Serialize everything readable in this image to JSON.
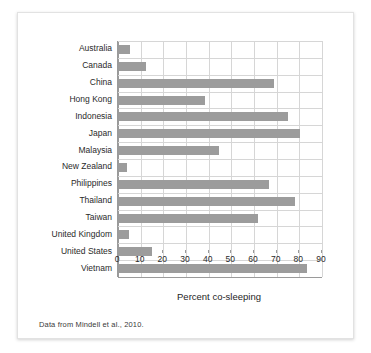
{
  "figure": {
    "caption": "Data from Mindell et al., 2010.",
    "bar_color": "#9c9c9c",
    "grid_color": "#d6d6d6",
    "axis_color": "#9a9a9a"
  },
  "chart_data": {
    "type": "bar",
    "orientation": "horizontal",
    "title": "",
    "xlabel": "Percent co-sleeping",
    "ylabel": "",
    "xlim": [
      0,
      90
    ],
    "xticks": [
      0,
      10,
      20,
      30,
      40,
      50,
      60,
      70,
      80,
      90
    ],
    "xtick_labels": [
      "0",
      "10",
      "20",
      "30",
      "40",
      "50",
      "60",
      "70",
      "80",
      "90"
    ],
    "grid": true,
    "legend": null,
    "categories": [
      "Australia",
      "Canada",
      "China",
      "Hong Kong",
      "Indonesia",
      "Japan",
      "Malaysia",
      "New Zealand",
      "Philippines",
      "Thailand",
      "Taiwan",
      "United Kingdom",
      "United States",
      "Vietnam"
    ],
    "values": [
      5,
      12,
      68.5,
      38,
      74.5,
      80,
      44,
      3.5,
      66,
      77.5,
      61.5,
      4.5,
      14.5,
      83
    ]
  }
}
